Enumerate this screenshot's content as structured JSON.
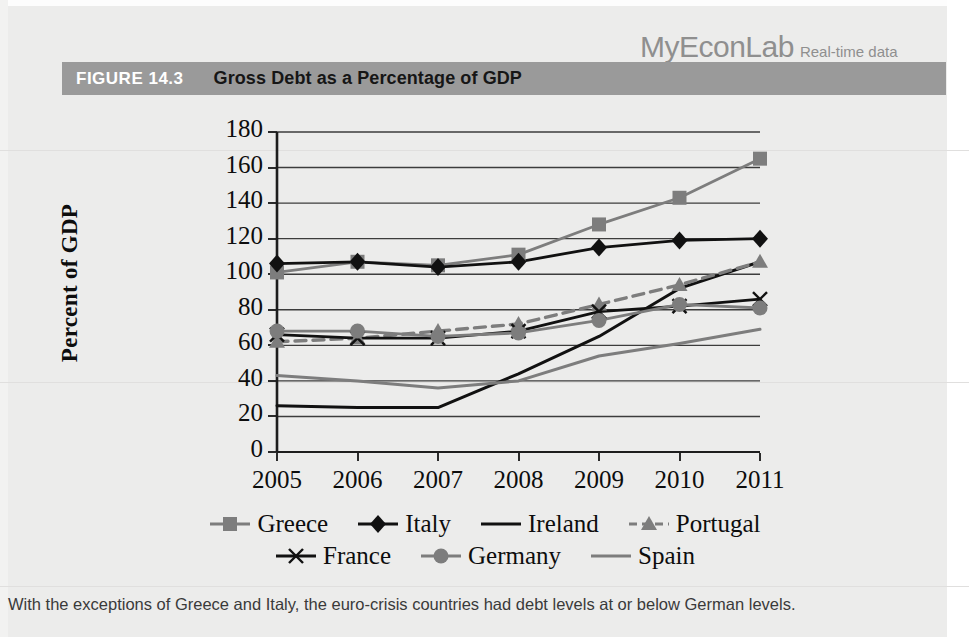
{
  "brand": {
    "name": "MyEconLab",
    "tagline": "Real-time data"
  },
  "figure": {
    "number": "FIGURE 14.3",
    "title": "Gross Debt as a Percentage of GDP"
  },
  "caption": "With the exceptions of Greece and Italy, the euro-crisis countries had debt levels at or below German levels.",
  "colors": {
    "header_bar": "#9a9a9a",
    "page_background": "#ececeb",
    "black_series": "#111111",
    "gray_series": "#7d7d7d",
    "grid": "#3c3c3c"
  },
  "chart_data": {
    "type": "line",
    "title": "Gross Debt as a Percentage of GDP",
    "xlabel": "",
    "ylabel": "Percent of GDP",
    "x": [
      2005,
      2006,
      2007,
      2008,
      2009,
      2010,
      2011
    ],
    "categories": [
      "2005",
      "2006",
      "2007",
      "2008",
      "2009",
      "2010",
      "2011"
    ],
    "ylim": [
      0,
      180
    ],
    "yticks": [
      0,
      20,
      40,
      60,
      80,
      100,
      120,
      140,
      160,
      180
    ],
    "ytick_labels": [
      "0",
      "20",
      "40",
      "60",
      "80",
      "100",
      "120",
      "140",
      "160",
      "180"
    ],
    "grid": true,
    "legend_position": "bottom",
    "series": [
      {
        "name": "Greece",
        "color": "#7d7d7d",
        "marker": "square",
        "dash": "solid",
        "values": [
          101,
          107,
          105,
          111,
          128,
          143,
          165
        ]
      },
      {
        "name": "Italy",
        "color": "#111111",
        "marker": "diamond",
        "dash": "solid",
        "values": [
          106,
          107,
          104,
          107,
          115,
          119,
          120
        ]
      },
      {
        "name": "Ireland",
        "color": "#111111",
        "marker": "none",
        "dash": "solid",
        "values": [
          26,
          25,
          25,
          44,
          65,
          92,
          107
        ]
      },
      {
        "name": "Portugal",
        "color": "#7d7d7d",
        "marker": "triangle",
        "dash": "dashed",
        "values": [
          62,
          64,
          68,
          72,
          83,
          94,
          107
        ]
      },
      {
        "name": "France",
        "color": "#111111",
        "marker": "x",
        "dash": "solid",
        "values": [
          66,
          64,
          64,
          68,
          79,
          82,
          86
        ]
      },
      {
        "name": "Germany",
        "color": "#7d7d7d",
        "marker": "circle",
        "dash": "solid",
        "values": [
          68,
          68,
          65,
          67,
          74,
          83,
          81
        ]
      },
      {
        "name": "Spain",
        "color": "#7d7d7d",
        "marker": "none",
        "dash": "solid",
        "values": [
          43,
          40,
          36,
          40,
          54,
          61,
          69
        ]
      }
    ]
  },
  "legend": {
    "rows": [
      [
        "Greece",
        "Italy",
        "Ireland",
        "Portugal"
      ],
      [
        "France",
        "Germany",
        "Spain"
      ]
    ]
  }
}
